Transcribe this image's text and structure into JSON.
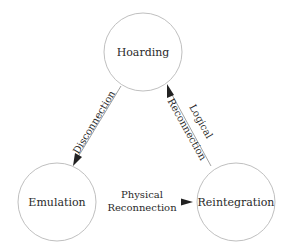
{
  "diagram": {
    "nodes": [
      {
        "id": "hoarding",
        "label": "Hoarding",
        "cx": 143,
        "cy": 52,
        "r": 39
      },
      {
        "id": "emulation",
        "label": "Emulation",
        "cx": 57,
        "cy": 202,
        "r": 39
      },
      {
        "id": "reintegration",
        "label": "Reintegration",
        "cx": 236,
        "cy": 202,
        "r": 39
      }
    ],
    "edges": [
      {
        "from": "hoarding",
        "to": "emulation",
        "label_lines": [
          "Disconnection"
        ]
      },
      {
        "from": "emulation",
        "to": "reintegration",
        "label_lines": [
          "Physical",
          "Reconnection"
        ]
      },
      {
        "from": "reintegration",
        "to": "hoarding",
        "label_lines": [
          "Logical",
          "Reconnection"
        ]
      }
    ]
  }
}
